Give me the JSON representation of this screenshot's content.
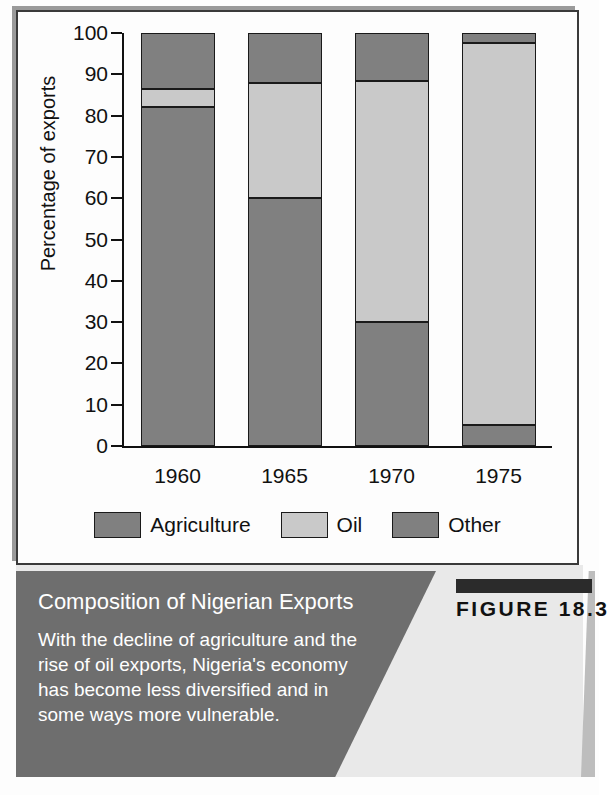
{
  "figure": {
    "number_label": "FIGURE 18.3",
    "title": "Composition of Nigerian Exports",
    "body": "With the decline of agriculture and the rise of oil exports, Nigeria's economy has become less diversified and in some ways more vulnerable."
  },
  "colors": {
    "agriculture": "#808080",
    "oil": "#c9c9c9",
    "other": "#808080",
    "outline": "#1a1a1a",
    "caption_panel": "#6e6e6e",
    "caption_light": "#e9e9e9",
    "figure_bar": "#2b2b2b",
    "text_light": "#ffffff",
    "text_dark": "#111111"
  },
  "chart_data": {
    "type": "bar",
    "subtype": "stacked-percentage",
    "title": "Composition of Nigerian Exports",
    "xlabel": "",
    "ylabel": "Percentage of exports",
    "categories": [
      "1960",
      "1965",
      "1970",
      "1975"
    ],
    "ylim": [
      0,
      100
    ],
    "yticks": [
      0,
      10,
      20,
      30,
      40,
      50,
      60,
      70,
      80,
      90,
      100
    ],
    "ytick_labels": [
      "0",
      "10",
      "20",
      "30",
      "40",
      "50",
      "60",
      "70",
      "80",
      "90",
      "100"
    ],
    "grid": false,
    "legend_position": "bottom",
    "series": [
      {
        "name": "Agriculture",
        "color": "#808080",
        "values": [
          82,
          60,
          30,
          5
        ]
      },
      {
        "name": "Oil",
        "color": "#c9c9c9",
        "values": [
          4.5,
          28,
          58.5,
          92.5
        ]
      },
      {
        "name": "Other",
        "color": "#808080",
        "values": [
          13.5,
          12,
          11.5,
          2.5
        ]
      }
    ],
    "cumulative_tops": [
      [
        82,
        86.5,
        100
      ],
      [
        60,
        88,
        100
      ],
      [
        30,
        88.5,
        100
      ],
      [
        5,
        97.5,
        100
      ]
    ]
  }
}
